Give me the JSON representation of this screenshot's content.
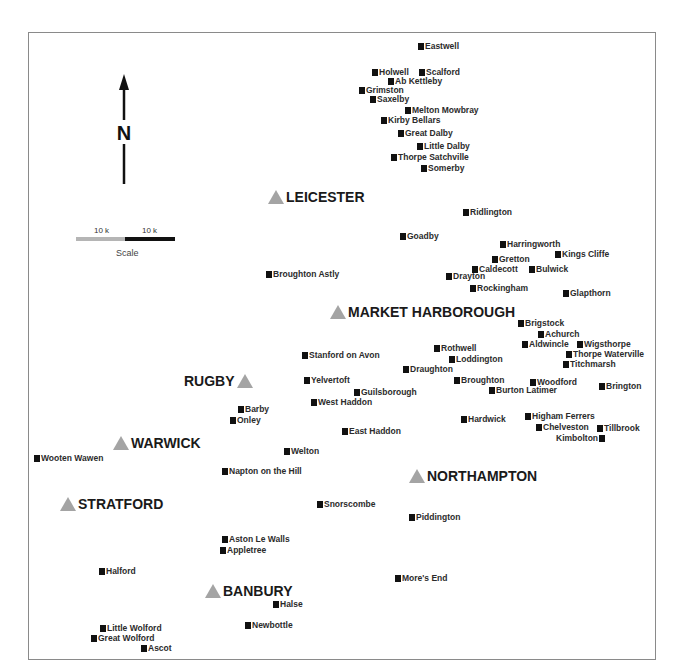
{
  "map": {
    "north_label": "N",
    "scale": {
      "segment_labels": [
        "10 k",
        "10 k"
      ],
      "caption": "Scale",
      "colors": [
        "#b5b5b5",
        "#111111"
      ]
    },
    "towns": [
      {
        "name": "LEICESTER",
        "x": 268,
        "y": 189,
        "marker_side": "left"
      },
      {
        "name": "MARKET HARBOROUGH",
        "x": 330,
        "y": 304,
        "marker_side": "left"
      },
      {
        "name": "RUGBY",
        "x": 184,
        "y": 373,
        "marker_side": "right"
      },
      {
        "name": "WARWICK",
        "x": 113,
        "y": 435,
        "marker_side": "left"
      },
      {
        "name": "NORTHAMPTON",
        "x": 409,
        "y": 468,
        "marker_side": "left"
      },
      {
        "name": "STRATFORD",
        "x": 60,
        "y": 496,
        "marker_side": "left"
      },
      {
        "name": "BANBURY",
        "x": 205,
        "y": 583,
        "marker_side": "left"
      }
    ],
    "villages": [
      {
        "name": "Eastwell",
        "x": 418,
        "y": 41
      },
      {
        "name": "Holwell",
        "x": 372,
        "y": 67
      },
      {
        "name": "Scalford",
        "x": 419,
        "y": 67
      },
      {
        "name": "Ab Kettleby",
        "x": 388,
        "y": 76
      },
      {
        "name": "Grimston",
        "x": 359,
        "y": 85
      },
      {
        "name": "Saxelby",
        "x": 370,
        "y": 94
      },
      {
        "name": "Melton Mowbray",
        "x": 405,
        "y": 105
      },
      {
        "name": "Kirby Bellars",
        "x": 381,
        "y": 115
      },
      {
        "name": "Great Dalby",
        "x": 398,
        "y": 128
      },
      {
        "name": "Little Dalby",
        "x": 417,
        "y": 141
      },
      {
        "name": "Thorpe Satchville",
        "x": 391,
        "y": 152
      },
      {
        "name": "Somerby",
        "x": 421,
        "y": 163
      },
      {
        "name": "Ridlington",
        "x": 463,
        "y": 207
      },
      {
        "name": "Goadby",
        "x": 400,
        "y": 231
      },
      {
        "name": "Harringworth",
        "x": 500,
        "y": 239
      },
      {
        "name": "Kings Cliffe",
        "x": 555,
        "y": 249
      },
      {
        "name": "Gretton",
        "x": 492,
        "y": 254
      },
      {
        "name": "Caldecott",
        "x": 472,
        "y": 264
      },
      {
        "name": "Bulwick",
        "x": 529,
        "y": 264
      },
      {
        "name": "Drayton",
        "x": 446,
        "y": 271
      },
      {
        "name": "Broughton Astly",
        "x": 266,
        "y": 269
      },
      {
        "name": "Rockingham",
        "x": 470,
        "y": 283
      },
      {
        "name": "Glapthorn",
        "x": 563,
        "y": 288
      },
      {
        "name": "Brigstock",
        "x": 518,
        "y": 318
      },
      {
        "name": "Achurch",
        "x": 538,
        "y": 329
      },
      {
        "name": "Aldwincle",
        "x": 522,
        "y": 339
      },
      {
        "name": "Wigsthorpe",
        "x": 577,
        "y": 339
      },
      {
        "name": "Rothwell",
        "x": 434,
        "y": 343
      },
      {
        "name": "Thorpe Waterville",
        "x": 566,
        "y": 349
      },
      {
        "name": "Stanford on Avon",
        "x": 302,
        "y": 350
      },
      {
        "name": "Loddington",
        "x": 449,
        "y": 354
      },
      {
        "name": "Titchmarsh",
        "x": 563,
        "y": 359
      },
      {
        "name": "Draughton",
        "x": 403,
        "y": 364
      },
      {
        "name": "Yelvertoft",
        "x": 304,
        "y": 375
      },
      {
        "name": "Broughton",
        "x": 454,
        "y": 375
      },
      {
        "name": "Woodford",
        "x": 530,
        "y": 377
      },
      {
        "name": "Burton Latimer",
        "x": 489,
        "y": 385
      },
      {
        "name": "Brington",
        "x": 599,
        "y": 381
      },
      {
        "name": "Guilsborough",
        "x": 354,
        "y": 387
      },
      {
        "name": "West Haddon",
        "x": 311,
        "y": 397
      },
      {
        "name": "Barby",
        "x": 238,
        "y": 404
      },
      {
        "name": "Onley",
        "x": 230,
        "y": 415
      },
      {
        "name": "Hardwick",
        "x": 461,
        "y": 414
      },
      {
        "name": "Higham Ferrers",
        "x": 525,
        "y": 411
      },
      {
        "name": "Chelveston",
        "x": 536,
        "y": 422
      },
      {
        "name": "Tillbrook",
        "x": 597,
        "y": 423
      },
      {
        "name": "Kimbolton",
        "x": 556,
        "y": 433,
        "marker_side": "right"
      },
      {
        "name": "East Haddon",
        "x": 342,
        "y": 426
      },
      {
        "name": "Welton",
        "x": 284,
        "y": 446
      },
      {
        "name": "Wooten Wawen",
        "x": 34,
        "y": 453
      },
      {
        "name": "Napton on the Hill",
        "x": 222,
        "y": 466
      },
      {
        "name": "Snorscombe",
        "x": 317,
        "y": 499
      },
      {
        "name": "Piddington",
        "x": 409,
        "y": 512
      },
      {
        "name": "Aston Le Walls",
        "x": 222,
        "y": 534
      },
      {
        "name": "Appletree",
        "x": 220,
        "y": 545
      },
      {
        "name": "Halford",
        "x": 99,
        "y": 566
      },
      {
        "name": "More's End",
        "x": 395,
        "y": 573
      },
      {
        "name": "Halse",
        "x": 273,
        "y": 599
      },
      {
        "name": "Newbottle",
        "x": 245,
        "y": 620
      },
      {
        "name": "Little Wolford",
        "x": 100,
        "y": 623
      },
      {
        "name": "Great Wolford",
        "x": 91,
        "y": 633
      },
      {
        "name": "Ascot",
        "x": 141,
        "y": 643
      }
    ]
  }
}
